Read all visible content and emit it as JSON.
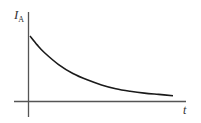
{
  "chart_data": {
    "type": "line",
    "title": "",
    "xlabel": "t",
    "ylabel": "I",
    "ylabel_subscript": "A",
    "grid": false,
    "legend": null,
    "ticks": {
      "x": [],
      "y": []
    },
    "series": [
      {
        "name": "I_A(t)",
        "shape": "exponential-decay",
        "x": [
          0,
          0.05,
          0.1,
          0.2,
          0.3,
          0.4,
          0.5,
          0.6,
          0.7,
          0.8,
          0.9,
          1.0
        ],
        "values": [
          1.0,
          0.86,
          0.74,
          0.55,
          0.41,
          0.31,
          0.23,
          0.17,
          0.13,
          0.1,
          0.08,
          0.06
        ]
      }
    ],
    "xlim": [
      0,
      1.05
    ],
    "ylim": [
      0,
      1.2
    ]
  },
  "style": {
    "axis_color": "#555555",
    "curve_color": "#1a1a1a",
    "label_color": "#333333"
  }
}
